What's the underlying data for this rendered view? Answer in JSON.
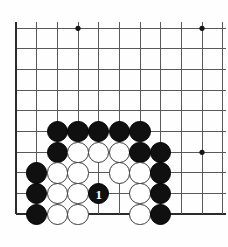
{
  "diagram": {
    "type": "go-board-corner",
    "board": {
      "columns": 11,
      "rows": 10,
      "origin_x": 16,
      "origin_y": 28.3,
      "spacing": 20.67,
      "line_color": "#59595b",
      "edge_color": "#2b2b2d",
      "background": "#fefefe",
      "edges": {
        "left": true,
        "bottom": true,
        "top": false,
        "right": false
      }
    },
    "star_points": [
      {
        "col": 4,
        "row": 1
      },
      {
        "col": 10,
        "row": 1
      },
      {
        "col": 10,
        "row": 7
      }
    ],
    "stones": [
      {
        "col": 3,
        "row": 6,
        "color": "black",
        "label": ""
      },
      {
        "col": 4,
        "row": 6,
        "color": "black",
        "label": ""
      },
      {
        "col": 5,
        "row": 6,
        "color": "black",
        "label": ""
      },
      {
        "col": 6,
        "row": 6,
        "color": "black",
        "label": ""
      },
      {
        "col": 7,
        "row": 6,
        "color": "black",
        "label": ""
      },
      {
        "col": 3,
        "row": 7,
        "color": "black",
        "label": ""
      },
      {
        "col": 4,
        "row": 7,
        "color": "white",
        "label": ""
      },
      {
        "col": 5,
        "row": 7,
        "color": "white",
        "label": ""
      },
      {
        "col": 6,
        "row": 7,
        "color": "white",
        "label": ""
      },
      {
        "col": 7,
        "row": 7,
        "color": "black",
        "label": ""
      },
      {
        "col": 8,
        "row": 7,
        "color": "black",
        "label": ""
      },
      {
        "col": 2,
        "row": 8,
        "color": "black",
        "label": ""
      },
      {
        "col": 3,
        "row": 8,
        "color": "white",
        "label": ""
      },
      {
        "col": 4,
        "row": 8,
        "color": "white",
        "label": ""
      },
      {
        "col": 6,
        "row": 8,
        "color": "white",
        "label": ""
      },
      {
        "col": 7,
        "row": 8,
        "color": "white",
        "label": ""
      },
      {
        "col": 8,
        "row": 8,
        "color": "black",
        "label": ""
      },
      {
        "col": 2,
        "row": 9,
        "color": "black",
        "label": ""
      },
      {
        "col": 3,
        "row": 9,
        "color": "white",
        "label": ""
      },
      {
        "col": 4,
        "row": 9,
        "color": "white",
        "label": ""
      },
      {
        "col": 5,
        "row": 9,
        "color": "black",
        "label": "1"
      },
      {
        "col": 7,
        "row": 9,
        "color": "white",
        "label": ""
      },
      {
        "col": 8,
        "row": 9,
        "color": "black",
        "label": ""
      },
      {
        "col": 2,
        "row": 10,
        "color": "black",
        "label": ""
      },
      {
        "col": 3,
        "row": 10,
        "color": "white",
        "label": ""
      },
      {
        "col": 4,
        "row": 10,
        "color": "white",
        "label": ""
      },
      {
        "col": 7,
        "row": 10,
        "color": "white",
        "label": ""
      },
      {
        "col": 8,
        "row": 10,
        "color": "black",
        "label": ""
      }
    ],
    "stone_radius": 10.6,
    "move_number_text": "1"
  }
}
